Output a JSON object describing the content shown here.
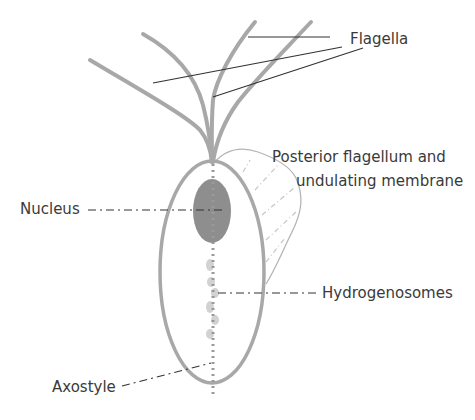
{
  "diagram": {
    "colors": {
      "cell_outline": "#a8a8a8",
      "nucleus_fill": "#8e8e8e",
      "leader_line": "#333333",
      "text": "#3a3a3a",
      "background": "#ffffff"
    },
    "labels": {
      "flagella": "Flagella",
      "posterior_line1": "Posterior flagellum and",
      "posterior_line2": "undulating membrane",
      "nucleus": "Nucleus",
      "hydrogenosomes": "Hydrogenosomes",
      "axostyle": "Axostyle"
    }
  }
}
